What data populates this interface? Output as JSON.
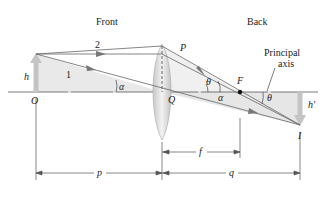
{
  "labels": {
    "front": "Front",
    "back": "Back",
    "ray1": "1",
    "ray2": "2",
    "object_height": "h",
    "image_height": "h'",
    "object_point": "O",
    "lens_center": "Q",
    "lens_top": "P",
    "focal_point": "F",
    "image_point": "I",
    "principal_axis_line1": "Principal",
    "principal_axis_line2": "axis",
    "alpha_object": "α",
    "alpha_image": "α",
    "theta_lens": "θ",
    "theta_image": "θ",
    "object_distance": "p",
    "image_distance": "q",
    "focal_length": "f"
  },
  "colors": {
    "axis": "#555555",
    "ray": "#666666",
    "shade": "#e6e6e6",
    "lens": "#d8d8d8",
    "arrow": "#bdbdbd",
    "focal_dot": "#111111"
  }
}
